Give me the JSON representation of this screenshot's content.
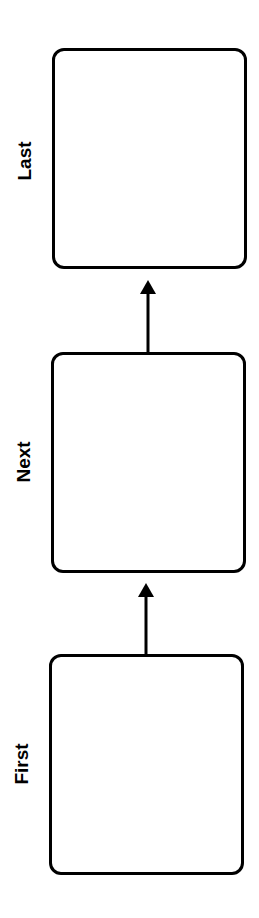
{
  "diagram": {
    "orientation": "bottom-to-top",
    "nodes": [
      {
        "id": "first",
        "label": "First"
      },
      {
        "id": "next",
        "label": "Next"
      },
      {
        "id": "last",
        "label": "Last"
      }
    ],
    "edges": [
      {
        "from": "first",
        "to": "next"
      },
      {
        "from": "next",
        "to": "last"
      }
    ],
    "colors": {
      "stroke": "#000000",
      "background": "#ffffff"
    }
  }
}
